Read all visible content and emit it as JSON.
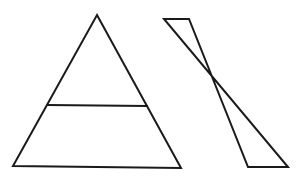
{
  "figure": {
    "width": 304,
    "height": 178,
    "background": "#ffffff",
    "stroke_color": "#1a1a1a",
    "stroke_width": 2
  },
  "shapes": {
    "triangle": {
      "label": "",
      "apex": [
        97,
        15
      ],
      "base_left": [
        13,
        166
      ],
      "base_right": [
        181,
        168
      ],
      "chord": {
        "left": [
          48,
          105
        ],
        "right": [
          147,
          106
        ]
      }
    },
    "bowtie": {
      "label": "",
      "top_left": [
        164,
        19
      ],
      "top_right": [
        189,
        19
      ],
      "bottom_left": [
        248,
        167
      ],
      "bottom_right": [
        288,
        167
      ],
      "crossing": [
        212,
        77
      ]
    }
  }
}
